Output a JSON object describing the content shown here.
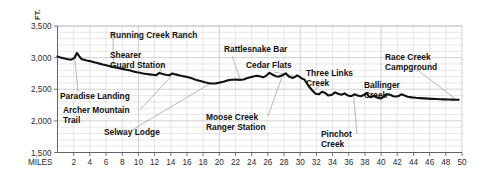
{
  "chart_data": {
    "type": "line",
    "title": "",
    "xlabel": "MILES",
    "ylabel": "FT.",
    "xlim": [
      0,
      50
    ],
    "ylim": [
      1500,
      3500
    ],
    "grid": true,
    "legend": "none",
    "y_ticks": [
      "1,500",
      "2,000",
      "2,500",
      "3,000",
      "3,500"
    ],
    "y_tick_values": [
      1500,
      2000,
      2500,
      3000,
      3500
    ],
    "y_minor_step": 100,
    "x_ticks": [
      "2",
      "4",
      "6",
      "8",
      "10",
      "12",
      "14",
      "16",
      "18",
      "20",
      "22",
      "24",
      "26",
      "28",
      "30",
      "32",
      "34",
      "36",
      "38",
      "40",
      "42",
      "44",
      "46",
      "48",
      "50"
    ],
    "x_tick_values": [
      2,
      4,
      6,
      8,
      10,
      12,
      14,
      16,
      18,
      20,
      22,
      24,
      26,
      28,
      30,
      32,
      34,
      36,
      38,
      40,
      42,
      44,
      46,
      48,
      50
    ],
    "x_minor_step": 2,
    "series": [
      {
        "name": "river-elevation-profile",
        "color": "#121212",
        "x": [
          0.0,
          0.4,
          0.9,
          1.3,
          1.7,
          2.1,
          2.4,
          2.7,
          3.0,
          3.3,
          3.6,
          4.0,
          4.4,
          4.8,
          5.2,
          5.6,
          6.0,
          6.5,
          7.0,
          7.5,
          8.0,
          8.5,
          9.0,
          9.4,
          9.8,
          10.2,
          10.6,
          11.0,
          11.4,
          11.8,
          12.2,
          12.6,
          13.0,
          13.4,
          13.8,
          14.2,
          14.6,
          15.0,
          15.4,
          15.8,
          16.2,
          16.6,
          17.0,
          17.4,
          17.8,
          18.2,
          18.6,
          19.0,
          19.5,
          20.0,
          20.5,
          21.0,
          21.5,
          22.0,
          22.5,
          23.0,
          23.4,
          23.8,
          24.2,
          24.6,
          25.0,
          25.4,
          25.8,
          26.2,
          26.6,
          27.0,
          27.4,
          27.8,
          28.2,
          28.6,
          29.0,
          29.3,
          29.6,
          29.9,
          30.2,
          30.5,
          30.8,
          31.1,
          31.5,
          31.9,
          32.3,
          32.7,
          33.1,
          33.5,
          33.9,
          34.3,
          34.7,
          35.1,
          35.5,
          35.9,
          36.3,
          36.7,
          37.1,
          37.5,
          37.9,
          38.2,
          38.5,
          38.8,
          39.1,
          39.4,
          39.7,
          40.0,
          40.3,
          40.7,
          41.1,
          41.5,
          41.9,
          42.2,
          42.5,
          42.9,
          43.3,
          43.8,
          44.3,
          44.8,
          45.3,
          45.8,
          46.3,
          46.8,
          47.3,
          47.8,
          48.3,
          48.8,
          49.3,
          49.6
        ],
        "y": [
          3020,
          3000,
          2985,
          2975,
          2968,
          2995,
          3075,
          3020,
          2975,
          2965,
          2955,
          2945,
          2930,
          2918,
          2905,
          2890,
          2878,
          2862,
          2848,
          2835,
          2822,
          2808,
          2795,
          2782,
          2768,
          2760,
          2750,
          2742,
          2735,
          2728,
          2722,
          2758,
          2742,
          2730,
          2722,
          2750,
          2735,
          2722,
          2710,
          2700,
          2688,
          2672,
          2655,
          2640,
          2625,
          2612,
          2600,
          2590,
          2592,
          2605,
          2620,
          2640,
          2650,
          2655,
          2648,
          2655,
          2675,
          2690,
          2700,
          2712,
          2706,
          2690,
          2712,
          2760,
          2730,
          2705,
          2700,
          2720,
          2752,
          2700,
          2680,
          2690,
          2720,
          2700,
          2670,
          2656,
          2600,
          2540,
          2480,
          2430,
          2420,
          2460,
          2440,
          2400,
          2412,
          2450,
          2430,
          2412,
          2435,
          2400,
          2390,
          2420,
          2400,
          2390,
          2412,
          2440,
          2385,
          2375,
          2400,
          2375,
          2362,
          2355,
          2380,
          2420,
          2415,
          2390,
          2385,
          2395,
          2420,
          2400,
          2382,
          2372,
          2365,
          2360,
          2356,
          2352,
          2348,
          2345,
          2342,
          2340,
          2338,
          2336,
          2334,
          2333
        ]
      }
    ],
    "annotations": [
      {
        "id": "paradise-landing",
        "label": "Paradise Landing",
        "lines": [
          "Paradise Landing"
        ],
        "x_mile": 2.1,
        "elev": 3055
      },
      {
        "id": "running-creek-ranch",
        "label": "Running Creek Ranch",
        "lines": [
          "Running Creek Ranch"
        ],
        "x_mile": 6.9,
        "elev": 2850
      },
      {
        "id": "shearer-guard-station",
        "label": "Shearer Guard Station",
        "lines": [
          "Shearer",
          "Guard Station"
        ],
        "x_mile": 12.6,
        "elev": 2757
      },
      {
        "id": "archer-mountain-trail",
        "label": "Archer Mountain Trail",
        "lines": [
          "Archer Mountain",
          "Trail"
        ],
        "x_mile": 14.2,
        "elev": 2748
      },
      {
        "id": "selway-lodge",
        "label": "Selway Lodge",
        "lines": [
          "Selway Lodge"
        ],
        "x_mile": 18.8,
        "elev": 2598
      },
      {
        "id": "moose-creek-rs",
        "label": "Moose Creek Ranger Station",
        "lines": [
          "Moose Creek",
          "Ranger Station"
        ],
        "x_mile": 27.9,
        "elev": 2745
      },
      {
        "id": "rattlesnake-bar",
        "label": "Rattlesnake Bar",
        "lines": [
          "Rattlesnake Bar"
        ],
        "x_mile": 23.0,
        "elev": 2652
      },
      {
        "id": "cedar-flats",
        "label": "Cedar Flats",
        "lines": [
          "Cedar Flats"
        ],
        "x_mile": 29.5,
        "elev": 2700
      },
      {
        "id": "three-links-creek",
        "label": "Three Links Creek",
        "lines": [
          "Three Links",
          "Creek"
        ],
        "x_mile": 31.5,
        "elev": 2480
      },
      {
        "id": "pinchot-creek",
        "label": "Pinchot Creek",
        "lines": [
          "Pinchot",
          "Creek"
        ],
        "x_mile": 36.6,
        "elev": 2418
      },
      {
        "id": "ballinger-creek",
        "label": "Ballinger Creek",
        "lines": [
          "Ballinger",
          "Creek"
        ],
        "x_mile": 41.0,
        "elev": 2415
      },
      {
        "id": "race-creek-campground",
        "label": "Race Creek Campground",
        "lines": [
          "Race Creek",
          "Campground"
        ],
        "x_mile": 49.3,
        "elev": 2333
      }
    ]
  }
}
